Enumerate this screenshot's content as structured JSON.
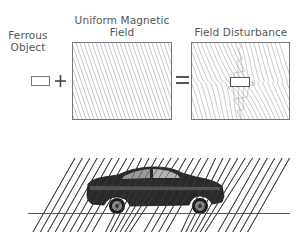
{
  "diagram": {
    "top_panel": {
      "ferrous_object": {
        "label_line1": "Ferrous",
        "label_line2": "Object"
      },
      "plus_sign": "+",
      "uniform_field": {
        "label_line1": "Uniform Magnetic",
        "label_line2": "Field"
      },
      "equals_sign": "=",
      "field_disturbance": {
        "label": "Field Disturbance"
      }
    },
    "bottom_panel": {
      "subject": "car",
      "description": "Car distorting uniform magnetic field lines above a ground line"
    },
    "colors": {
      "text": "#555555",
      "box_border": "#777777",
      "field_lines": "#aaaaaa",
      "car_lines": "#333333",
      "ground": "#555555"
    }
  }
}
